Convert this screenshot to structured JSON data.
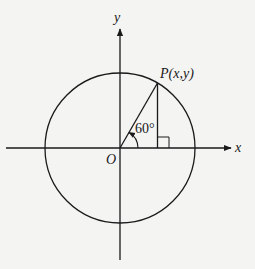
{
  "diagram": {
    "type": "unit-circle",
    "labels": {
      "y_axis": "y",
      "x_axis": "x",
      "origin": "O",
      "point": "P(x,y)",
      "angle": "60°"
    },
    "geometry": {
      "center": [
        120,
        148
      ],
      "radius": 75,
      "angle_deg": 60
    },
    "colors": {
      "stroke": "#1a1a1a",
      "background": "#f4f4f3"
    }
  }
}
